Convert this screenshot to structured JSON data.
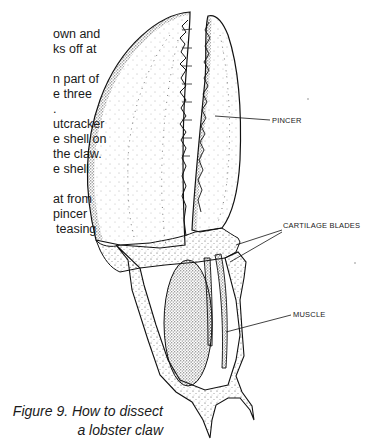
{
  "body_text": {
    "lines": [
      {
        "text": "own and",
        "x": 53,
        "y": 34
      },
      {
        "text": "ks off at",
        "x": 53,
        "y": 49
      },
      {
        "text": "n part of",
        "x": 53,
        "y": 79
      },
      {
        "text": "e three",
        "x": 53,
        "y": 94
      },
      {
        "text": ".",
        "x": 53,
        "y": 109
      },
      {
        "text": "utcracker",
        "x": 53,
        "y": 124
      },
      {
        "text": "e shell on",
        "x": 53,
        "y": 139
      },
      {
        "text": "the claw.",
        "x": 53,
        "y": 154
      },
      {
        "text": "e shell",
        "x": 53,
        "y": 169
      },
      {
        "text": "at from",
        "x": 53,
        "y": 199
      },
      {
        "text": "pincer",
        "x": 53,
        "y": 214
      },
      {
        "text": "teasing",
        "x": 53,
        "y": 229
      }
    ]
  },
  "figure": {
    "labels": {
      "pincer": "PINCER",
      "cartilage_blades": "CARTILAGE BLADES",
      "muscle": "MUSCLE"
    },
    "caption": {
      "line1": "Figure 9. How to dissect",
      "line2": "a lobster claw"
    }
  }
}
